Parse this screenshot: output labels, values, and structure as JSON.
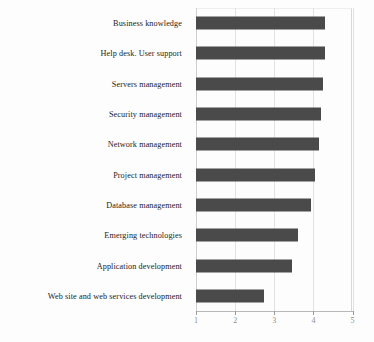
{
  "chart_data": {
    "type": "bar",
    "orientation": "horizontal",
    "title": "",
    "xlabel": "",
    "ylabel": "",
    "xlim": [
      1,
      5
    ],
    "xticks": [
      "1",
      "2",
      "3",
      "4",
      "5"
    ],
    "grid": true,
    "legend": "none",
    "bar_color": "#4a4a4a",
    "categories": [
      "Business knowledge",
      "Help desk. User support",
      "Servers management",
      "Security management",
      "Network management",
      "Project management",
      "Database management",
      "Emerging technologies",
      "Application development",
      "Web site and web services development"
    ],
    "values": [
      4.3,
      4.3,
      4.25,
      4.2,
      4.15,
      4.05,
      3.95,
      3.6,
      3.45,
      2.75
    ]
  }
}
